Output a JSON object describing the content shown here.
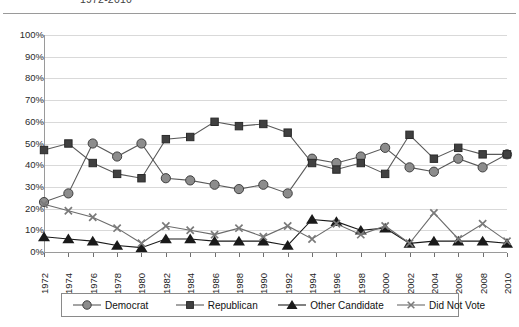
{
  "chart": {
    "title": "1972-2010",
    "title_visible_fragment": "1972-2010"
  },
  "chart_data": {
    "type": "line",
    "title": "1972-2010",
    "xlabel": "",
    "ylabel": "",
    "ylim": [
      0,
      100
    ],
    "grid": true,
    "legend_position": "bottom",
    "y_tick_labels": [
      "100%",
      "90%",
      "80%",
      "70%",
      "60%",
      "50%",
      "40%",
      "30%",
      "20%",
      "10%",
      "0%"
    ],
    "y_ticks": [
      100,
      90,
      80,
      70,
      60,
      50,
      40,
      30,
      20,
      10,
      0
    ],
    "categories": [
      "1972",
      "1974",
      "1976",
      "1978",
      "1980",
      "1982",
      "1984",
      "1986",
      "1988",
      "1990",
      "1992",
      "1994",
      "1996",
      "1998",
      "2000",
      "2002",
      "2004",
      "2006",
      "2008",
      "2010"
    ],
    "series": [
      {
        "name": "Democrat",
        "marker": "circle",
        "color": "#8c8c8c",
        "line_color": "#595959",
        "values": [
          23,
          27,
          50,
          44,
          50,
          34,
          33,
          31,
          29,
          31,
          27,
          43,
          41,
          44,
          48,
          39,
          37,
          43,
          39,
          45
        ]
      },
      {
        "name": "Republican",
        "marker": "square",
        "color": "#404040",
        "line_color": "#595959",
        "values": [
          47,
          50,
          41,
          36,
          34,
          52,
          53,
          60,
          58,
          59,
          55,
          41,
          38,
          41,
          36,
          54,
          43,
          48,
          45,
          45
        ]
      },
      {
        "name": "Other Candidate",
        "marker": "triangle",
        "color": "#1a1a1a",
        "line_color": "#1a1a1a",
        "values": [
          7,
          6,
          5,
          3,
          2,
          6,
          6,
          5,
          5,
          5,
          3,
          15,
          14,
          10,
          11,
          4,
          5,
          5,
          5,
          4
        ]
      },
      {
        "name": "Did Not Vote",
        "marker": "cross",
        "color": "#7a7a7a",
        "line_color": "#6b6b6b",
        "values": [
          22,
          19,
          16,
          11,
          4,
          12,
          10,
          8,
          11,
          7,
          12,
          6,
          13,
          8,
          12,
          4,
          18,
          6,
          13,
          5
        ]
      }
    ]
  },
  "legend": {
    "items": [
      {
        "label": "Democrat",
        "marker": "circle-marker"
      },
      {
        "label": "Republican",
        "marker": "square-marker"
      },
      {
        "label": "Other Candidate",
        "marker": "triangle-marker"
      },
      {
        "label": "Did Not Vote",
        "marker": "cross-marker"
      }
    ]
  }
}
